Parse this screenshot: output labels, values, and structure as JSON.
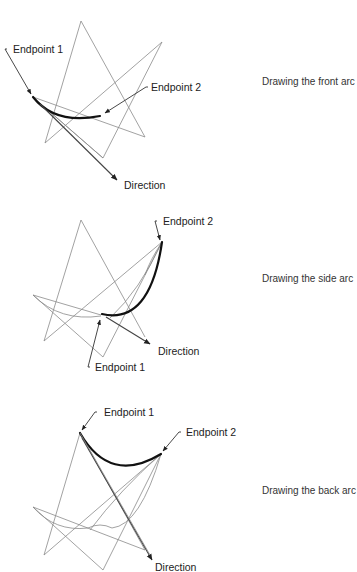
{
  "figures": [
    {
      "id": "front",
      "caption": "Drawing the front arc",
      "labels": {
        "endpoint1": "Endpoint 1",
        "endpoint2": "Endpoint 2",
        "direction": "Direction"
      }
    },
    {
      "id": "side",
      "caption": "Drawing the side arc",
      "labels": {
        "endpoint1": "Endpoint 1",
        "endpoint2": "Endpoint 2",
        "direction": "Direction"
      }
    },
    {
      "id": "back",
      "caption": "Drawing the back arc",
      "labels": {
        "endpoint1": "Endpoint 1",
        "endpoint2": "Endpoint 2",
        "direction": "Direction"
      }
    }
  ],
  "colors": {
    "arc": "#111111",
    "construction_lines": "#8a8a8a",
    "text": "#222222"
  }
}
